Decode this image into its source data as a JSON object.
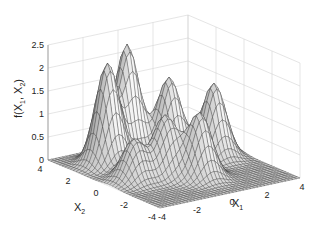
{
  "chart_data": {
    "type": "surface",
    "title": "",
    "xlabel": "X",
    "xlabel_sub": "1",
    "ylabel": "X",
    "ylabel_sub": "2",
    "zlabel": "f(X",
    "zlabel_parts": [
      "f(X",
      "1",
      ", X",
      "2",
      ")"
    ],
    "xlim": [
      -4,
      4
    ],
    "ylim": [
      -4,
      4
    ],
    "zlim": [
      0,
      2.5
    ],
    "x_ticks": [
      "-4",
      "-2",
      "0",
      "2",
      "4"
    ],
    "y_ticks": [
      "4",
      "2",
      "0",
      "-2",
      "-4"
    ],
    "z_ticks": [
      "0",
      "0.5",
      "1",
      "1.5",
      "2",
      "2.5"
    ],
    "grid": true,
    "surface_color": "#d8d8d8",
    "mesh_color": "#333333",
    "peaks": [
      {
        "x1": -2.2,
        "x2": 2.0,
        "height": 2.2
      },
      {
        "x1": -0.6,
        "x2": 2.6,
        "height": 2.4
      },
      {
        "x1": 1.0,
        "x2": 1.6,
        "height": 1.7
      },
      {
        "x1": 2.6,
        "x2": 0.4,
        "height": 1.6
      },
      {
        "x1": -1.0,
        "x2": -0.6,
        "height": 1.3
      },
      {
        "x1": 0.2,
        "x2": -1.6,
        "height": 1.4
      },
      {
        "x1": -2.6,
        "x2": -0.4,
        "height": 0.9
      }
    ]
  }
}
